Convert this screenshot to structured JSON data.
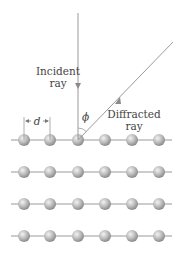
{
  "diagram": {
    "labels": {
      "incident_line1": "Incident",
      "incident_line2": "ray",
      "diffracted_line1": "Diffracted",
      "diffracted_line2": "ray",
      "angle": "ϕ",
      "spacing": "d"
    },
    "lattice": {
      "rows": 4,
      "atoms_per_row": 6,
      "row_y": [
        140,
        172,
        204,
        236
      ],
      "atom_x": [
        24,
        50,
        78,
        105,
        132,
        159
      ]
    },
    "colors": {
      "line": "#9a9a9a",
      "atom": "#b8b8b8",
      "text": "#444444"
    }
  }
}
